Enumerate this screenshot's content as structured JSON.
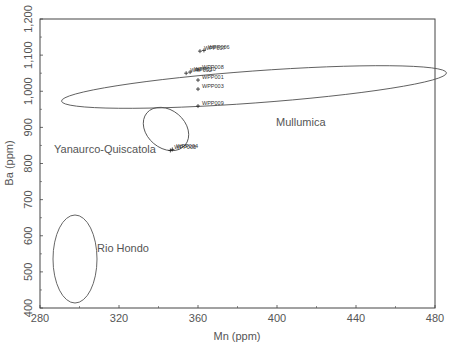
{
  "chart_data": {
    "type": "scatter",
    "title": "",
    "xlabel": "Mn (ppm)",
    "ylabel": "Ba (ppm)",
    "xlim": [
      280,
      480
    ],
    "ylim": [
      400,
      1200
    ],
    "xticks": [
      280,
      320,
      360,
      400,
      440,
      480
    ],
    "xtick_labels": [
      "280",
      "320",
      "360",
      "400",
      "440",
      "480"
    ],
    "yticks": [
      400,
      500,
      600,
      700,
      800,
      900,
      1000,
      1100,
      1200
    ],
    "ytick_labels": [
      "400",
      "500",
      "600",
      "700",
      "800",
      "900",
      "1,000",
      "1,100",
      "1,200"
    ],
    "grid": false,
    "marker": "+",
    "series": [
      {
        "name": "WPP samples",
        "points": [
          {
            "label": "WPP007",
            "x": 361,
            "y": 1111
          },
          {
            "label": "WPP006",
            "x": 363,
            "y": 1113
          },
          {
            "label": "WPP008",
            "x": 360,
            "y": 1059
          },
          {
            "label": "WPP002",
            "x": 354,
            "y": 1050
          },
          {
            "label": "WPP010",
            "x": 356,
            "y": 1053
          },
          {
            "label": "WPP001",
            "x": 360,
            "y": 1031
          },
          {
            "label": "WPP003",
            "x": 360,
            "y": 1006
          },
          {
            "label": "WPP009",
            "x": 360,
            "y": 959
          },
          {
            "label": "WPP004",
            "x": 347,
            "y": 839
          },
          {
            "label": "WPP005",
            "x": 346,
            "y": 836
          }
        ]
      }
    ],
    "regions": [
      {
        "name": "Mullumica",
        "shape": "ellipse",
        "cx_mn": 388,
        "cy_ba": 1051,
        "label_x": 400,
        "label_y": 990
      },
      {
        "name": "Yanaurco-Quiscatola",
        "shape": "ellipse",
        "cx_mn": 344,
        "cy_ba": 933,
        "label_x": 285,
        "label_y": 845
      },
      {
        "name": "Rio Hondo",
        "shape": "ellipse",
        "cx_mn": 298,
        "cy_ba": 495,
        "label_x": 310,
        "label_y": 555
      }
    ]
  }
}
